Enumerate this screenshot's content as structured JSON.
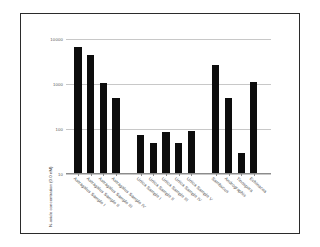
{
  "chart_data": {
    "type": "bar",
    "title": "",
    "subtitle": "",
    "xlabel": "",
    "ylabel": "N-oxide concentration (0.0 nM)",
    "yscale": "log",
    "ylim": [
      10,
      10000
    ],
    "ytick_labels": [
      "10000",
      "1000",
      "100",
      "10"
    ],
    "ytick_values": [
      10000,
      1000,
      100,
      10
    ],
    "grid": true,
    "legend": false,
    "legend_position": "none",
    "bar_color": "#0d0d0d",
    "categories": [
      "Astragalus Sample I",
      "Astragalus Sample II",
      "Astragalus Sample III",
      "Astragalus Sample IV",
      "Urtica Sample I",
      "Urtica Sample II",
      "Urtica Sample III",
      "Urtica Sample IV",
      "Urtica Sample V",
      "Sambucus",
      "Andrographis",
      "Tinospora",
      "Echinacea"
    ],
    "values": [
      6500,
      4500,
      1050,
      480,
      75,
      50,
      85,
      50,
      90,
      2600,
      480,
      30,
      1100
    ],
    "groups": [
      {
        "name": "Astragalus",
        "indices": [
          0,
          1,
          2,
          3
        ]
      },
      {
        "name": "Urtica",
        "indices": [
          4,
          5,
          6,
          7,
          8
        ]
      },
      {
        "name": "Other",
        "indices": [
          9,
          10,
          11,
          12
        ]
      }
    ]
  },
  "figure": {
    "border_color": "#2b2b2b",
    "background": "#ffffff",
    "grid_color": "#c8c8c8",
    "axis_color": "#8c8c8c"
  }
}
